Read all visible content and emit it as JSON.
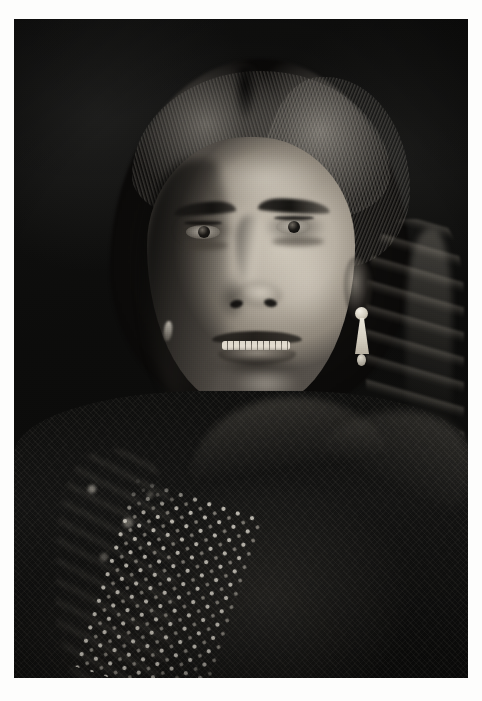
{
  "document": {
    "medium": "black-and-white photographic print",
    "orientation": "portrait",
    "border_color": "#ffffff",
    "plate_color": "#0b0b0a",
    "caption": ""
  },
  "subject": {
    "description": "Portrait of a Native American woman facing the camera",
    "pose": "head and shoulders, three-quarter light from the right",
    "expression": "neutral, lips slightly parted showing upper teeth",
    "gaze": "directed toward viewer"
  },
  "features": {
    "hair": "dark hair parted in the center, pulled back, with a braid falling over the right shoulder",
    "hair_part_label": "center part",
    "eyes": "dark brown eyes",
    "brow_left": "left eyebrow",
    "brow_right": "right eyebrow",
    "nose": "nose with shadowed left side",
    "mouth": "mouth, slightly open",
    "teeth": "upper teeth",
    "chin": "chin highlight",
    "ear_right": "right ear, visible"
  },
  "jewelry": {
    "earring_right": "long dentalium shell earring with bead at top",
    "earring_left": "small shell earring in shadow",
    "shell_color": "#e2ddd1",
    "bead_color": "#f2efe6"
  },
  "garment": {
    "robe": "dark woven blanket or robe draped over the shoulders",
    "collar": "high dark collar around the neck",
    "beadwork": "light-colored beaded band running diagonally across the lower left",
    "beadwork_color": "#e8e3d4"
  },
  "background": {
    "description": "plain dark studio backdrop, mottled",
    "color": "#0d0d0c"
  },
  "palette": {
    "highlight": "#d6cfc0",
    "midtone": "#8e867a",
    "shadow": "#14130f",
    "black": "#090908",
    "paper_white": "#fdfdfc"
  },
  "geometry": {
    "canvas_width": 482,
    "canvas_height": 701,
    "plate_left": 14,
    "plate_top": 19,
    "plate_width": 454,
    "plate_height": 659
  }
}
